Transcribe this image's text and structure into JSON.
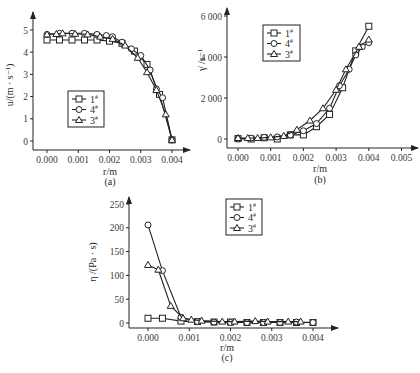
{
  "chart_data": [
    {
      "id": "a",
      "type": "line",
      "caption": "(a)",
      "xlabel": "r/m",
      "ylabel": "u/(m · s⁻¹)",
      "xlim": [
        -0.0003,
        0.0044
      ],
      "ylim": [
        0,
        5.5
      ],
      "xticks": [
        "0.000",
        "0.001",
        "0.002",
        "0.003",
        "0.004"
      ],
      "xtick_values": [
        0.0,
        0.001,
        0.002,
        0.003,
        0.004
      ],
      "yticks": [
        "0",
        "1",
        "2",
        "3",
        "4",
        "5"
      ],
      "ytick_values": [
        0,
        1,
        2,
        3,
        4,
        5
      ],
      "legend": [
        "1#",
        "4#",
        "3#"
      ],
      "legend_position": "middle-left",
      "grid": false,
      "series": [
        {
          "name": "1#",
          "marker": "square",
          "x": [
            0.0,
            0.0004,
            0.0008,
            0.0012,
            0.0016,
            0.002,
            0.0024,
            0.0028,
            0.0032,
            0.0036,
            0.004
          ],
          "y": [
            4.55,
            4.55,
            4.55,
            4.55,
            4.55,
            4.5,
            4.4,
            4.05,
            3.45,
            2.1,
            0.05
          ]
        },
        {
          "name": "4#",
          "marker": "circle",
          "x": [
            0.0,
            0.0004,
            0.0008,
            0.0012,
            0.0016,
            0.0019,
            0.0021,
            0.0024,
            0.0027,
            0.003,
            0.0033,
            0.0035,
            0.0037,
            0.004
          ],
          "y": [
            4.8,
            4.85,
            4.85,
            4.85,
            4.8,
            4.75,
            4.7,
            4.45,
            4.15,
            3.85,
            3.2,
            2.35,
            1.95,
            0.05
          ]
        },
        {
          "name": "3#",
          "marker": "triangle",
          "x": [
            0.0,
            0.0003,
            0.0005,
            0.0009,
            0.0013,
            0.0017,
            0.0021,
            0.0025,
            0.0029,
            0.0032,
            0.0035,
            0.0038,
            0.004
          ],
          "y": [
            4.8,
            4.82,
            4.85,
            4.83,
            4.8,
            4.7,
            4.6,
            4.3,
            3.75,
            3.1,
            2.3,
            1.2,
            0.05
          ]
        }
      ]
    },
    {
      "id": "b",
      "type": "line",
      "caption": "(b)",
      "xlabel": "r/m",
      "ylabel": "γ̇ /s⁻¹",
      "xlim": [
        -0.0003,
        0.0055
      ],
      "ylim": [
        0,
        6500
      ],
      "xticks": [
        "0.000",
        "0.001",
        "0.002",
        "0.003",
        "0.004",
        "0.005"
      ],
      "xtick_values": [
        0.0,
        0.001,
        0.002,
        0.003,
        0.004,
        0.005
      ],
      "yticks": [
        "0",
        "2 000",
        "4 000",
        "6 000"
      ],
      "ytick_values": [
        0,
        2000,
        4000,
        6000
      ],
      "legend": [
        "1#",
        "4#",
        "3#"
      ],
      "legend_position": "upper-left",
      "grid": false,
      "series": [
        {
          "name": "1#",
          "marker": "square",
          "x": [
            0.0,
            0.0004,
            0.0008,
            0.0012,
            0.0016,
            0.002,
            0.0024,
            0.0028,
            0.0032,
            0.0036,
            0.004
          ],
          "y": [
            20,
            0,
            60,
            0,
            200,
            200,
            600,
            1200,
            2500,
            4300,
            5500
          ]
        },
        {
          "name": "4#",
          "marker": "circle",
          "x": [
            0.0,
            0.0004,
            0.0008,
            0.0012,
            0.0016,
            0.002,
            0.0024,
            0.0028,
            0.0031,
            0.0034,
            0.0036,
            0.0038,
            0.004
          ],
          "y": [
            0,
            40,
            80,
            100,
            200,
            400,
            750,
            1500,
            2600,
            3400,
            4100,
            4500,
            4700
          ]
        },
        {
          "name": "3#",
          "marker": "triangle",
          "x": [
            0.0,
            0.0003,
            0.0006,
            0.001,
            0.0014,
            0.0018,
            0.0022,
            0.0026,
            0.003,
            0.0033,
            0.0037,
            0.004
          ],
          "y": [
            50,
            50,
            50,
            80,
            150,
            450,
            900,
            1500,
            2400,
            3400,
            4500,
            4850
          ]
        }
      ]
    },
    {
      "id": "c",
      "type": "line",
      "caption": "(c)",
      "xlabel": "r/m",
      "ylabel": "η /(Pa · s)",
      "xlim": [
        -0.0004,
        0.0047
      ],
      "ylim": [
        -10,
        260
      ],
      "xticks": [
        "0.000",
        "0.001",
        "0.002",
        "0.003",
        "0.004"
      ],
      "xtick_values": [
        0.0,
        0.001,
        0.002,
        0.003,
        0.004
      ],
      "yticks": [
        "0",
        "50",
        "100",
        "150",
        "200",
        "250"
      ],
      "ytick_values": [
        0,
        50,
        100,
        150,
        200,
        250
      ],
      "legend": [
        "1#",
        "4#",
        "3#"
      ],
      "legend_position": "upper-center",
      "grid": false,
      "series": [
        {
          "name": "1#",
          "marker": "square",
          "x": [
            0.0,
            0.00035,
            0.0008,
            0.0012,
            0.0016,
            0.002,
            0.0024,
            0.0028,
            0.0032,
            0.0036,
            0.004
          ],
          "y": [
            10,
            10,
            4,
            3,
            2,
            2,
            1,
            1,
            1,
            1,
            1
          ]
        },
        {
          "name": "4#",
          "marker": "circle",
          "x": [
            0.0,
            0.00035,
            0.0008,
            0.0012,
            0.0016,
            0.002,
            0.0024,
            0.0028,
            0.0032,
            0.0036,
            0.004
          ],
          "y": [
            206,
            110,
            12,
            3,
            2,
            1,
            1,
            1,
            1,
            2,
            1
          ]
        },
        {
          "name": "3#",
          "marker": "triangle",
          "x": [
            0.0,
            0.00025,
            0.00055,
            0.00085,
            0.00105,
            0.0013,
            0.0018,
            0.0021,
            0.0026,
            0.0029,
            0.0034,
            0.0037
          ],
          "y": [
            122,
            112,
            36,
            10,
            7,
            5,
            3,
            3,
            4,
            3,
            3,
            3
          ]
        }
      ]
    }
  ],
  "captions": {
    "a": "(a)",
    "b": "(b)",
    "c": "(c)"
  },
  "xlabel": "r/m",
  "ylabels": {
    "a": "u/(m · s⁻¹)",
    "b": "γ̇ /s⁻¹",
    "c": "η /(Pa · s)"
  },
  "legend_labels": [
    "1#",
    "4#",
    "3#"
  ]
}
